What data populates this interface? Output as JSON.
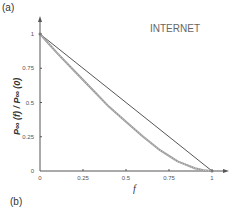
{
  "panels": {
    "a": "(a)",
    "b": "(b)"
  },
  "chart_data": {
    "type": "line",
    "title": "INTERNET",
    "xlabel": "f",
    "ylabel": "P∞ (f) / P∞ (0)",
    "xlim": [
      0,
      1
    ],
    "ylim": [
      0,
      1
    ],
    "x_ticks": [
      "0",
      "0.25",
      "0.5",
      "0.75",
      "1"
    ],
    "y_ticks": [
      "0",
      "0.25",
      "0.5",
      "0.75",
      "1"
    ],
    "grid": false,
    "series": [
      {
        "name": "linear reference",
        "color": "#555555",
        "style": "solid",
        "x": [
          0,
          1
        ],
        "y": [
          1,
          0
        ]
      },
      {
        "name": "INTERNET",
        "color": "#999999",
        "style": "dotted-thick",
        "x": [
          0,
          0.1,
          0.2,
          0.3,
          0.4,
          0.5,
          0.6,
          0.7,
          0.8,
          0.9,
          0.95,
          1.0
        ],
        "y": [
          1,
          0.86,
          0.73,
          0.6,
          0.47,
          0.36,
          0.25,
          0.15,
          0.07,
          0.02,
          0.005,
          0
        ]
      }
    ]
  }
}
